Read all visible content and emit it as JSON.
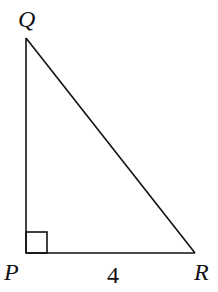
{
  "diagram": {
    "type": "right-triangle",
    "vertices": {
      "Q": {
        "label": "Q",
        "x": 26,
        "y": 38
      },
      "P": {
        "label": "P",
        "x": 26,
        "y": 253
      },
      "R": {
        "label": "R",
        "x": 195,
        "y": 253
      }
    },
    "right_angle_at": "P",
    "right_angle_marker_size": 21,
    "side_labels": {
      "PR": "4"
    },
    "stroke_color": "#111111",
    "background": "#ffffff"
  }
}
